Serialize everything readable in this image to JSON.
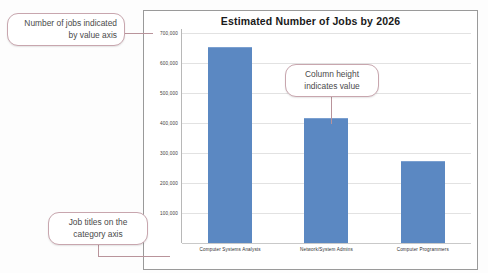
{
  "chart_data": {
    "type": "bar",
    "title": "Estimated Number of Jobs by 2026",
    "categories": [
      "Computer Systems Analysts",
      "Network/System Admins",
      "Computer Programmers"
    ],
    "values": [
      650000,
      415000,
      270000
    ],
    "xlabel": "",
    "ylabel": "",
    "ylim": [
      0,
      700000
    ],
    "ytick_labels": [
      "700,000",
      "600,000",
      "500,000",
      "400,000",
      "300,000",
      "200,000",
      "100,000"
    ],
    "ytick_values": [
      700000,
      600000,
      500000,
      400000,
      300000,
      200000,
      100000
    ],
    "grid": true,
    "legend": false,
    "series_color": "#5b88c2"
  },
  "callouts": {
    "value_axis": "Number of jobs indicated by value axis",
    "column_height": "Column height indicates value",
    "category_axis": "Job titles on the category axis"
  },
  "colors": {
    "bar": "#5b88c2",
    "callout_border": "#c8a6ae",
    "leader_line": "#b9949b",
    "gridline": "#e2e2e2",
    "chart_border": "#9a9a9a"
  }
}
